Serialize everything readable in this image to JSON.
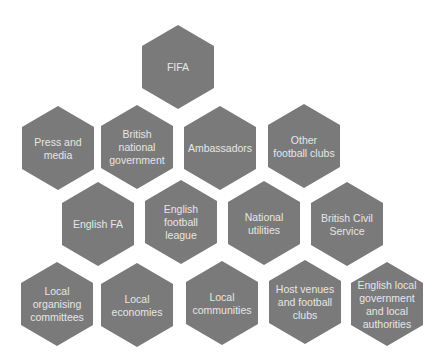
{
  "diagram": {
    "colors": {
      "hexagon_fill": "#7a7a7a",
      "text": "#e6e6e6",
      "background": "#ffffff"
    },
    "nodes": [
      {
        "id": "fifa",
        "row": 1,
        "lines": [
          "FIFA"
        ]
      },
      {
        "id": "press-and-media",
        "row": 2,
        "lines": [
          "Press and",
          "media"
        ]
      },
      {
        "id": "british-national-government",
        "row": 2,
        "lines": [
          "British",
          "national",
          "government"
        ]
      },
      {
        "id": "ambassadors",
        "row": 2,
        "lines": [
          "Ambassadors"
        ]
      },
      {
        "id": "other-football-clubs",
        "row": 2,
        "lines": [
          "Other",
          "football clubs"
        ]
      },
      {
        "id": "english-fa",
        "row": 3,
        "lines": [
          "English FA"
        ]
      },
      {
        "id": "english-football-league",
        "row": 3,
        "lines": [
          "English",
          "football",
          "league"
        ]
      },
      {
        "id": "national-utilities",
        "row": 3,
        "lines": [
          "National",
          "utilities"
        ]
      },
      {
        "id": "british-civil-service",
        "row": 3,
        "lines": [
          "British Civil",
          "Service"
        ]
      },
      {
        "id": "local-organising-committees",
        "row": 4,
        "lines": [
          "Local",
          "organising",
          "committees"
        ]
      },
      {
        "id": "local-economies",
        "row": 4,
        "lines": [
          "Local",
          "economies"
        ]
      },
      {
        "id": "local-communities",
        "row": 4,
        "lines": [
          "Local",
          "communities"
        ]
      },
      {
        "id": "host-venues-and-football-clubs",
        "row": 4,
        "lines": [
          "Host venues",
          "and football",
          "clubs"
        ]
      },
      {
        "id": "english-local-government",
        "row": 4,
        "lines": [
          "English local",
          "government",
          "and local",
          "authorities"
        ]
      }
    ]
  }
}
